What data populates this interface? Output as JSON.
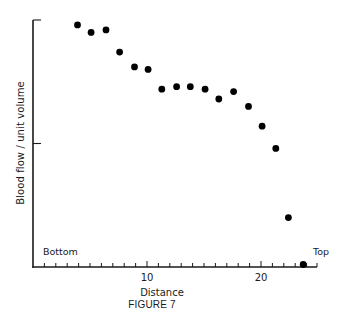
{
  "figure": {
    "caption": "FIGURE 7",
    "ylabel": "Blood flow / unit volume",
    "xlabel": "Distance",
    "x_start_label": "Bottom",
    "x_end_label": "Top",
    "x_tick_labels": [
      "10",
      "20"
    ]
  },
  "chart_data": {
    "type": "scatter",
    "title": "",
    "caption": "FIGURE 7",
    "xlabel": "Distance",
    "ylabel": "Blood flow / unit volume",
    "annotations": [
      {
        "text": "Bottom",
        "position": "left end of x-axis"
      },
      {
        "text": "Top",
        "position": "right end of x-axis"
      }
    ],
    "xlim": [
      0,
      25
    ],
    "ylim": [
      0,
      1
    ],
    "x_ticks": [
      1,
      2,
      3,
      4,
      5,
      6,
      7,
      8,
      9,
      10,
      11,
      12,
      13,
      14,
      15,
      16,
      17,
      18,
      19,
      20,
      21,
      22,
      23,
      24
    ],
    "x_tick_labels": {
      "10": "10",
      "20": "20"
    },
    "y_ticks": [
      0.5,
      1.0
    ],
    "y_tick_labels": [],
    "y_units": "relative (unlabeled)",
    "grid": false,
    "legend": null,
    "series": [
      {
        "name": "Blood flow",
        "marker": "filled-circle",
        "color": "#000000",
        "x": [
          3.9,
          5.1,
          6.4,
          7.6,
          8.9,
          10.1,
          11.3,
          12.6,
          13.8,
          15.1,
          16.3,
          17.6,
          18.9,
          20.1,
          21.3,
          22.4,
          23.7
        ],
        "y": [
          0.98,
          0.95,
          0.96,
          0.87,
          0.81,
          0.8,
          0.72,
          0.73,
          0.73,
          0.72,
          0.68,
          0.71,
          0.65,
          0.57,
          0.48,
          0.2,
          0.01
        ]
      }
    ]
  },
  "style": {
    "axis_color": "#1a1a1a",
    "point_color": "#000000",
    "background": "#ffffff"
  }
}
